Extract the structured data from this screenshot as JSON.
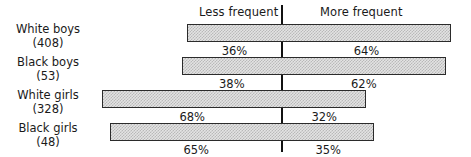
{
  "chart_data": {
    "type": "bar",
    "subtype": "diverging-stacked-bar",
    "title": "",
    "xlabel": "",
    "ylabel": "",
    "grid": false,
    "legend_position": "top",
    "axis": {
      "center_label_left": "Less frequent",
      "center_label_right": "More frequent"
    },
    "categories": [
      "White boys (408)",
      "Black boys (53)",
      "White girls (328)",
      "Black girls (48)"
    ],
    "series": [
      {
        "name": "Less frequent",
        "values": [
          36,
          38,
          68,
          65
        ],
        "unit": "%"
      },
      {
        "name": "More frequent",
        "values": [
          64,
          62,
          32,
          35
        ],
        "unit": "%"
      }
    ],
    "rows": [
      {
        "group": "White boys",
        "group_label": "White boys",
        "count_label": "(408)",
        "n": 408,
        "less_frequent": 36,
        "more_frequent": 64,
        "less_label": "36%",
        "more_label": "64%"
      },
      {
        "group": "Black boys",
        "group_label": "Black boys",
        "count_label": "(53)",
        "n": 53,
        "less_frequent": 38,
        "more_frequent": 62,
        "less_label": "38%",
        "more_label": "62%"
      },
      {
        "group": "White girls",
        "group_label": "White girls",
        "count_label": "(328)",
        "n": 328,
        "less_frequent": 68,
        "more_frequent": 32,
        "less_label": "68%",
        "more_label": "32%"
      },
      {
        "group": "Black girls",
        "group_label": "Black girls",
        "count_label": "(48)",
        "n": 48,
        "less_frequent": 65,
        "more_frequent": 35,
        "less_label": "65%",
        "more_label": "35%"
      }
    ],
    "colors": {
      "bar_fill": "#e3e3e3",
      "bar_pattern": "#b9b9b9",
      "bar_border": "#2b2b2b",
      "axis_line": "#111111",
      "text": "#1a1a1a",
      "background": "#ffffff"
    }
  }
}
